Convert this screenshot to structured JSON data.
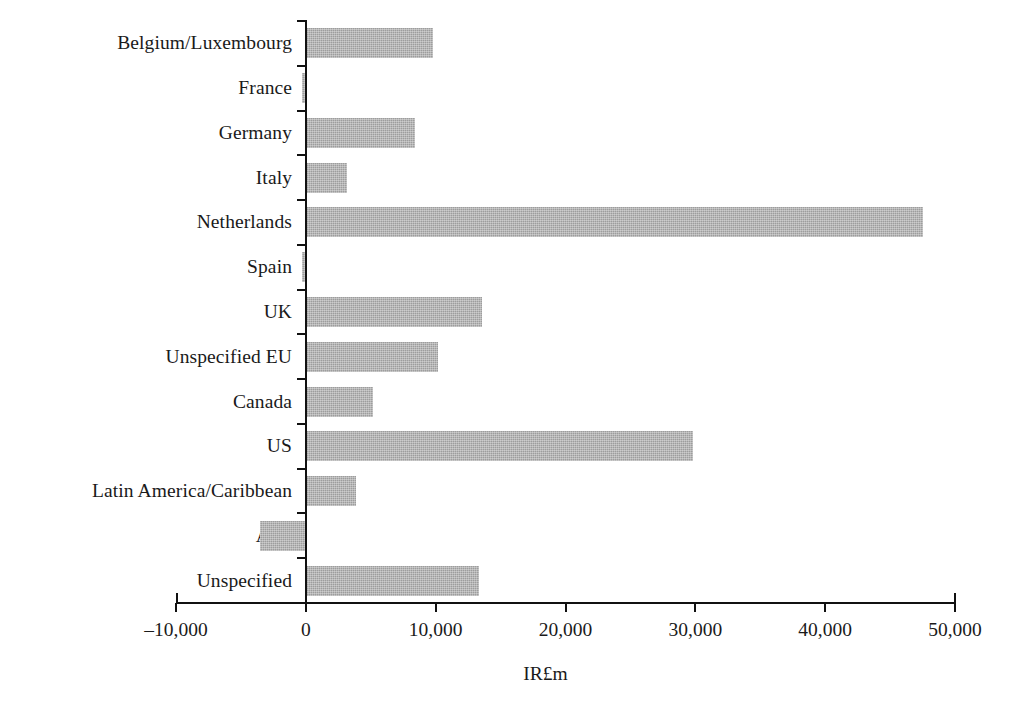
{
  "chart_data": {
    "type": "bar",
    "orientation": "horizontal",
    "title": "",
    "subtitle": "",
    "xlabel": "IR£m",
    "ylabel": "",
    "xlim": [
      -10000,
      50000
    ],
    "xticks": [
      -10000,
      0,
      10000,
      20000,
      30000,
      40000,
      50000
    ],
    "xtick_labels": [
      "–10,000",
      "0",
      "10,000",
      "20,000",
      "30,000",
      "40,000",
      "50,000"
    ],
    "grid": false,
    "legend": false,
    "legend_position": "none",
    "bar_color": "#9d9d9d",
    "axis_color": "#111111",
    "categories": [
      "Belgium/Luxembourg",
      "France",
      "Germany",
      "Italy",
      "Netherlands",
      "Spain",
      "UK",
      "Unspecified EU",
      "Canada",
      "US",
      "Latin America/Caribbean",
      "Asia",
      "Unspecified"
    ],
    "values": [
      9800,
      -300,
      8400,
      3200,
      47500,
      -300,
      13600,
      10200,
      5200,
      29800,
      3900,
      -3500,
      13300
    ]
  }
}
